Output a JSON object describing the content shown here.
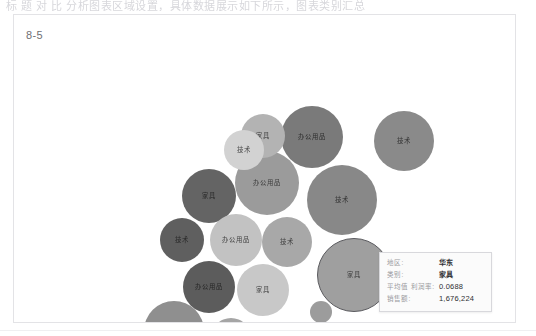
{
  "page": {
    "top_cut_text": "标    题    对    比    分析图表区域设置，具体数据展示如下所示，图表类别汇总"
  },
  "panel": {
    "title": "8-5"
  },
  "tooltip": {
    "name": "chart-tooltip",
    "rows": [
      {
        "key": "地区:",
        "value": "华东",
        "bold": true
      },
      {
        "key": "类别:",
        "value": "家具",
        "bold": true
      },
      {
        "key": "平均值 利润率:",
        "value": "0.0688",
        "bold": false
      },
      {
        "key": "销售额:",
        "value": "1,676,224",
        "bold": false
      }
    ]
  },
  "chart_data": {
    "type": "scatter",
    "subtype": "packed-bubble",
    "title": "8-5",
    "xlabel": "",
    "ylabel": "",
    "grid": false,
    "legend": "none",
    "color_field": "平均值 利润率",
    "size_field": "销售额",
    "label_field": "类别",
    "categories": [
      "家具",
      "技术",
      "办公用品"
    ],
    "colors": {
      "selected_outline": "#5b5b5f",
      "panel_border": "#e3e3e6",
      "tooltip_bg": "#fbfbfb",
      "tooltip_border": "#d8d8dc"
    },
    "points": [
      {
        "id": 1,
        "label": "家具",
        "cx": 248,
        "cy": 86,
        "r": 22,
        "color": "#b3b3b3"
      },
      {
        "id": 2,
        "label": "技术",
        "cx": 229,
        "cy": 100,
        "r": 20,
        "color": "#d2d2d2"
      },
      {
        "id": 3,
        "label": "办公用品",
        "cx": 297,
        "cy": 87,
        "r": 31,
        "color": "#7a7a7a"
      },
      {
        "id": 4,
        "label": "技术",
        "cx": 389,
        "cy": 91,
        "r": 30,
        "color": "#8a8a8a"
      },
      {
        "id": 5,
        "label": "办公用品",
        "cx": 252,
        "cy": 133,
        "r": 32,
        "color": "#9b9b9b"
      },
      {
        "id": 6,
        "label": "家具",
        "cx": 194,
        "cy": 146,
        "r": 27,
        "color": "#646464"
      },
      {
        "id": 7,
        "label": "技术",
        "cx": 327,
        "cy": 150,
        "r": 35,
        "color": "#888888"
      },
      {
        "id": 8,
        "label": "技术",
        "cx": 167,
        "cy": 190,
        "r": 22,
        "color": "#5f5f5f"
      },
      {
        "id": 9,
        "label": "办公用品",
        "cx": 221,
        "cy": 190,
        "r": 26,
        "color": "#c2c2c2"
      },
      {
        "id": 10,
        "label": "技术",
        "cx": 272,
        "cy": 192,
        "r": 25,
        "color": "#a8a8a8"
      },
      {
        "id": 11,
        "label": "办公用品",
        "cx": 194,
        "cy": 237,
        "r": 26,
        "color": "#5c5c5c"
      },
      {
        "id": 12,
        "label": "家具",
        "cx": 248,
        "cy": 240,
        "r": 26,
        "color": "#c8c8c8"
      },
      {
        "id": 13,
        "label": "家具",
        "cx": 339,
        "cy": 225,
        "r": 37,
        "color": "#9f9f9f",
        "selected": true
      },
      {
        "id": 14,
        "label": "家具",
        "cx": 159,
        "cy": 281,
        "r": 30,
        "color": "#8f8f8f"
      },
      {
        "id": 15,
        "label": "",
        "cx": 216,
        "cy": 288,
        "r": 20,
        "color": "#a5a5a5"
      },
      {
        "id": 16,
        "label": "家具",
        "cx": 254,
        "cy": 299,
        "r": 17,
        "color": "#b0b0b0"
      },
      {
        "id": 17,
        "label": "技术",
        "cx": 292,
        "cy": 286,
        "r": 14,
        "color": "#8b8b8b"
      },
      {
        "id": 18,
        "label": "",
        "cx": 306,
        "cy": 262,
        "r": 11,
        "color": "#9c9c9c"
      }
    ]
  }
}
